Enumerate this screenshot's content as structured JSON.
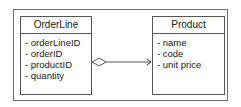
{
  "diagram": {
    "type": "uml-class-diagram",
    "classes": [
      {
        "name": "OrderLine",
        "attributes": [
          "- orderLineID",
          "- orderID",
          "- productID",
          "- quantity"
        ]
      },
      {
        "name": "Product",
        "attributes": [
          "- name",
          "- code",
          "- unit price"
        ]
      }
    ],
    "relationship": {
      "from": "OrderLine",
      "to": "Product",
      "kind": "aggregation",
      "navigable": true
    }
  }
}
